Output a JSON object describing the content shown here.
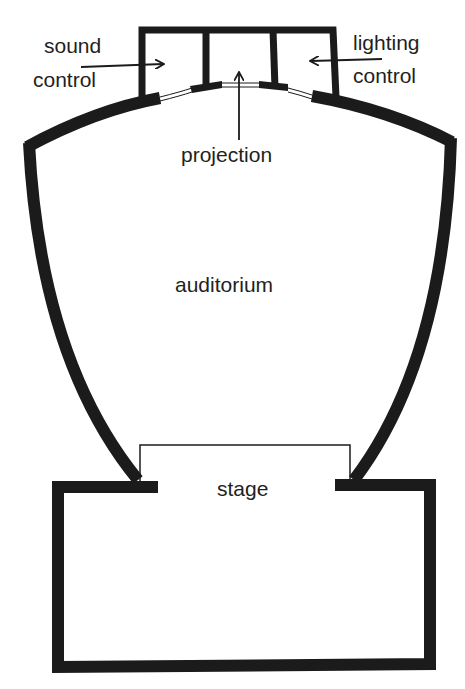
{
  "diagram": {
    "type": "theatre-plan",
    "wall_color": "#1b1b1b",
    "background": "#ffffff",
    "labels": {
      "sound_control_line1": "sound",
      "sound_control_line2": "control",
      "lighting_control_line1": "lighting",
      "lighting_control_line2": "control",
      "projection": "projection",
      "auditorium": "auditorium",
      "stage": "stage"
    },
    "regions": [
      {
        "id": "sound-control-booth",
        "label": "sound control"
      },
      {
        "id": "projection-booth",
        "label": "projection"
      },
      {
        "id": "lighting-control-booth",
        "label": "lighting control"
      },
      {
        "id": "auditorium",
        "label": "auditorium"
      },
      {
        "id": "stage",
        "label": "stage"
      }
    ]
  }
}
